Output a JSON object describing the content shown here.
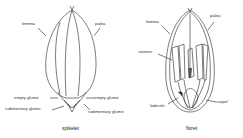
{
  "spikelet": {
    "caption": "spikelet",
    "labels": {
      "lemma": "lemma",
      "palea": "palea",
      "empty_glume_left": "empty glume",
      "empty_glume_right": "empty glume",
      "rudimentary_glume_left": "rudimentary glume",
      "rudimentary_glume_right": "rudimentary glume"
    }
  },
  "floret": {
    "caption": "floret",
    "labels": {
      "lemma": "lemma",
      "palea": "palea",
      "stamen": "stamen",
      "lodicule": "lodicule",
      "carpel": "carpel"
    }
  },
  "colors": {
    "line": "#444444",
    "background": "#ffffff"
  }
}
